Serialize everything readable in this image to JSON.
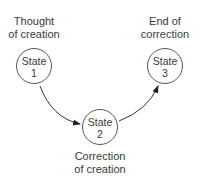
{
  "diagram": {
    "type": "state-transition",
    "states": [
      {
        "id": "state-1",
        "name": "State",
        "number": "1",
        "caption_line1": "Thought",
        "caption_line2": "of creation"
      },
      {
        "id": "state-2",
        "name": "State",
        "number": "2",
        "caption_line1": "Correction",
        "caption_line2": "of creation"
      },
      {
        "id": "state-3",
        "name": "State",
        "number": "3",
        "caption_line1": "End of",
        "caption_line2": "correction"
      }
    ],
    "transitions": [
      {
        "from": "state-1",
        "to": "state-2"
      },
      {
        "from": "state-2",
        "to": "state-3"
      }
    ],
    "colors": {
      "stroke": "#555555",
      "text": "#3a3a3a",
      "background": "#ffffff"
    }
  }
}
